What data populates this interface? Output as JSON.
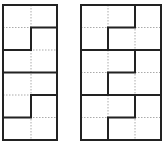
{
  "diagram": {
    "colors": {
      "background": "#ffffff",
      "bold_line": "#222222",
      "dashed_line": "#aaaaaa"
    },
    "left_grid": {
      "columns": 2,
      "rows": 6,
      "x": 3,
      "y": 5,
      "width": 54,
      "height": 135
    },
    "right_grid": {
      "columns": 3,
      "rows": 6,
      "x": 81,
      "y": 5,
      "width": 80,
      "height": 135
    }
  }
}
